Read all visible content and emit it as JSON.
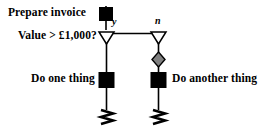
{
  "diagram": {
    "type": "flowchart",
    "background_color": "#ffffff",
    "line_color": "#000000",
    "node_fill_process": "#000000",
    "node_fill_decision": "#ffffff",
    "node_fill_diamond": "#808080",
    "labels": {
      "prepare_invoice": "Prepare invoice",
      "value_question": "Value > £1,000?",
      "do_one_thing": "Do one thing",
      "do_another_thing": "Do another thing",
      "branch_yes": "y",
      "branch_no": "n"
    },
    "nodes": [
      {
        "id": "start",
        "shape": "filled-square",
        "label": "Prepare invoice"
      },
      {
        "id": "decision-yes",
        "shape": "hollow-triangle-down",
        "label": "y"
      },
      {
        "id": "decision-no",
        "shape": "hollow-triangle-down",
        "label": "n"
      },
      {
        "id": "gray-diamond",
        "shape": "gray-diamond",
        "label": ""
      },
      {
        "id": "action-left",
        "shape": "filled-square",
        "label": "Do one thing"
      },
      {
        "id": "action-right",
        "shape": "filled-square",
        "label": "Do another thing"
      },
      {
        "id": "terminator-left",
        "shape": "zigzag",
        "label": ""
      },
      {
        "id": "terminator-right",
        "shape": "zigzag",
        "label": ""
      }
    ]
  }
}
